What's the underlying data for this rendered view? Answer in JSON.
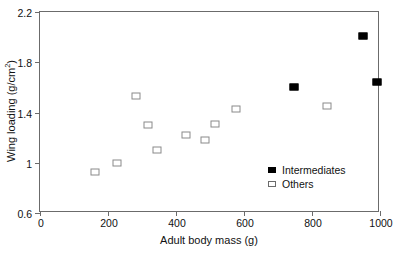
{
  "chart_data": {
    "type": "scatter",
    "title": "",
    "xlabel": "Adult body mass (g)",
    "ylabel": "Wing loading (g/cm",
    "ylabel_sup": "2",
    "ylabel_suffix": ")",
    "xlim": [
      0,
      1000
    ],
    "ylim": [
      0.6,
      2.2
    ],
    "xticks": [
      0,
      200,
      400,
      600,
      800,
      1000
    ],
    "xtick_labels": [
      "0",
      "200",
      "400",
      "600",
      "800",
      "1000"
    ],
    "yticks": [
      0.6,
      1.0,
      1.4,
      1.8,
      2.2
    ],
    "ytick_labels": [
      "0.6",
      "1",
      "1.4",
      "1.8",
      "2.2"
    ],
    "grid": false,
    "legend_position": "inside-lower-right",
    "series": [
      {
        "name": "Intermediates",
        "marker": "filled-square",
        "color": "#000000",
        "points": [
          {
            "x": 747,
            "y": 1.6
          },
          {
            "x": 950,
            "y": 2.01
          },
          {
            "x": 990,
            "y": 1.64
          }
        ]
      },
      {
        "name": "Others",
        "marker": "open-square",
        "color": "#8a8a8a",
        "points": [
          {
            "x": 162,
            "y": 0.93
          },
          {
            "x": 226,
            "y": 1.0
          },
          {
            "x": 282,
            "y": 1.53
          },
          {
            "x": 318,
            "y": 1.3
          },
          {
            "x": 345,
            "y": 1.1
          },
          {
            "x": 430,
            "y": 1.22
          },
          {
            "x": 485,
            "y": 1.18
          },
          {
            "x": 515,
            "y": 1.31
          },
          {
            "x": 577,
            "y": 1.43
          },
          {
            "x": 845,
            "y": 1.45
          }
        ]
      }
    ]
  },
  "legend": {
    "items": [
      {
        "label": "Intermediates",
        "marker": "filled-square"
      },
      {
        "label": "Others",
        "marker": "open-square"
      }
    ]
  }
}
